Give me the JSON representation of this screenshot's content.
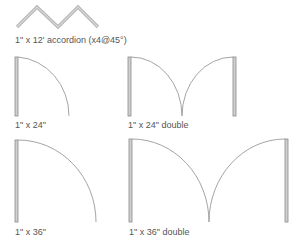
{
  "colors": {
    "line": "#a9a9a9",
    "arc": "#9a9a9a",
    "leaf_fill": "#d0d0d0",
    "leaf_stroke": "#8a8a8a",
    "text": "#555555"
  },
  "symbols": [
    {
      "id": "accordion",
      "label": "1\" x 12' accordion (x4@45°)"
    },
    {
      "id": "door-24",
      "label": "1\" x 24\""
    },
    {
      "id": "door-24-double",
      "label": "1\" x 24\" double"
    },
    {
      "id": "door-36",
      "label": "1\" x 36\""
    },
    {
      "id": "door-36-double",
      "label": "1\" x 36\" double"
    }
  ]
}
